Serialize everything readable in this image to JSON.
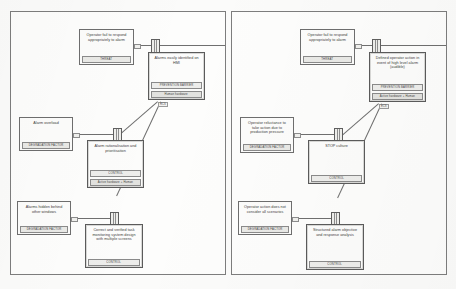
{
  "document": {
    "title": "Bowtie barrier analysis diagram",
    "panels": [
      {
        "id": "left",
        "nodes": [
          {
            "key": "l-threat-1",
            "name": "threat-operator-fail-respond",
            "title": "Operator fail to respond appropriately to alarm",
            "bands": [
              "THREAT"
            ],
            "kind": "threat"
          },
          {
            "key": "l-barrier-1",
            "name": "barrier-alarms-identified-hmi",
            "title": "Alarms easily identified on HMI",
            "bands": [
              "PREVENTION BARRIER",
              "Human hardware"
            ],
            "kind": "barrier"
          },
          {
            "key": "l-degr-1",
            "name": "degradation-alarm-overload",
            "title": "Alarm overload",
            "bands": [
              "DEGRADATION FACTOR"
            ],
            "kind": "degradation"
          },
          {
            "key": "l-ctrl-1",
            "name": "control-alarm-rationalisation",
            "title": "Alarm rationalisation and prioritisation",
            "bands": [
              "CONTROL",
              "Active hardware + Human"
            ],
            "kind": "control"
          },
          {
            "key": "l-degr-2",
            "name": "degradation-alarms-hidden",
            "title": "Alarms hidden behind other windows",
            "bands": [
              "DEGRADATION FACTOR"
            ],
            "kind": "degradation"
          },
          {
            "key": "l-ctrl-2",
            "name": "control-monitoring-system-design",
            "title": "Correct and verified task monitoring system design with multiple screens",
            "bands": [
              "CONTROL"
            ],
            "kind": "control"
          }
        ],
        "tags": [
          "RCS",
          "RCS",
          "RCS"
        ]
      },
      {
        "id": "right",
        "nodes": [
          {
            "key": "r-threat-1",
            "name": "threat-operator-fail-respond",
            "title": "Operator fail to respond appropriately to alarm",
            "bands": [
              "THREAT"
            ],
            "kind": "threat"
          },
          {
            "key": "r-barrier-1",
            "name": "barrier-defined-operator-action",
            "title": "Defined operator action in event of high level alarm (audible)",
            "bands": [
              "PREVENTION BARRIER",
              "Active hardware + Human"
            ],
            "kind": "barrier"
          },
          {
            "key": "r-degr-1",
            "name": "degradation-operator-reluctance",
            "title": "Operator reluctance to take action due to production pressure",
            "bands": [
              "DEGRADATION FACTOR"
            ],
            "kind": "degradation"
          },
          {
            "key": "r-ctrl-1",
            "name": "control-stop-culture",
            "title": "STOP culture",
            "bands": [
              "CONTROL"
            ],
            "kind": "control"
          },
          {
            "key": "r-degr-2",
            "name": "degradation-action-scenarios",
            "title": "Operator action does not consider all scenarios",
            "bands": [
              "DEGRADATION FACTOR"
            ],
            "kind": "degradation"
          },
          {
            "key": "r-ctrl-2",
            "name": "control-structured-alarm-analysis",
            "title": "Structured alarm objective and response analysis",
            "bands": [
              "CONTROL"
            ],
            "kind": "control"
          }
        ],
        "tags": [
          "ECS",
          "ECS",
          "ECS"
        ]
      }
    ]
  },
  "colors": {
    "paper": "#fbfbfa",
    "ink": "#3a3a3a",
    "line": "#6f6f6f",
    "band": "#ededeb"
  }
}
